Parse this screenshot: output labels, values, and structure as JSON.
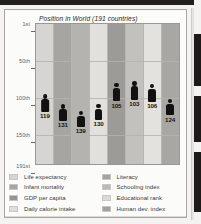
{
  "chart_data": {
    "type": "bar",
    "title": "Position in World (191 countries)",
    "xlabel": "",
    "ylabel": "",
    "ylim": [
      1,
      191
    ],
    "grid": true,
    "legend_position": "bottom",
    "ytick_labels": [
      "1st",
      "50th",
      "100th",
      "150th",
      "191st"
    ],
    "ytick_values": [
      1,
      50,
      100,
      150,
      191
    ],
    "categories": [
      "Life expectancy",
      "Infant mortality",
      "GDP per capita",
      "Daily calorie intake",
      "Literacy",
      "Schooling index",
      "Educational rank",
      "Human dev. index"
    ],
    "values": [
      119,
      131,
      139,
      130,
      105,
      103,
      106,
      124
    ],
    "value_labels": [
      "119",
      "131",
      "139",
      "130",
      "105",
      "103",
      "106",
      "124"
    ],
    "band_colors": [
      "#d7d5d2",
      "#a7a5a2",
      "#b5b3b0",
      "#e2e0dd",
      "#9d9b98",
      "#c3c1be",
      "#e4e2df",
      "#a9a7a4"
    ]
  },
  "chart": {
    "title": "Position in World (191 countries)",
    "y_labels": [
      "1st",
      "50th",
      "100th",
      "150th",
      "191st"
    ],
    "markers": [
      {
        "value": "119",
        "rank": 119
      },
      {
        "value": "131",
        "rank": 131
      },
      {
        "value": "139",
        "rank": 139
      },
      {
        "value": "130",
        "rank": 130
      },
      {
        "value": "105",
        "rank": 105
      },
      {
        "value": "103",
        "rank": 103
      },
      {
        "value": "106",
        "rank": 106
      },
      {
        "value": "124",
        "rank": 124
      }
    ]
  },
  "legend": {
    "left": [
      {
        "label": "Life expectancy",
        "color": "#d7d5d2"
      },
      {
        "label": "Infant mortality",
        "color": "#a7a5a2"
      },
      {
        "label": "GDP per capita",
        "color": "#97958f"
      },
      {
        "label": "Daily calorie intake",
        "color": "#dfddd9"
      }
    ],
    "right": [
      {
        "label": "Literacy",
        "color": "#a5a3a0"
      },
      {
        "label": "Schooling index",
        "color": "#bcbab7"
      },
      {
        "label": "Educational rank",
        "color": "#dcdad7"
      },
      {
        "label": "Human dev. index",
        "color": "#a3a19e"
      }
    ]
  }
}
